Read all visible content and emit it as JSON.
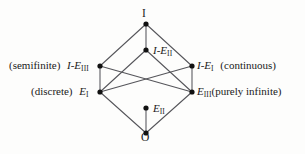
{
  "diagram": {
    "background_color": "#fdfdfc",
    "edge_color": "#55555a",
    "node_color": "#111111",
    "nodes": [
      {
        "id": "top",
        "label": "I",
        "label_html": "I",
        "x": 146,
        "y": 24,
        "label_position": "above"
      },
      {
        "id": "ie2",
        "label": "I-E_II",
        "base": "I-E",
        "subscript": "II",
        "x": 146,
        "y": 50,
        "label_position": "right"
      },
      {
        "id": "ie3",
        "label": "I-E_III",
        "base": "I-E",
        "subscript": "III",
        "prefix_note": "(semifinite)",
        "x": 100,
        "y": 66,
        "label_position": "left"
      },
      {
        "id": "ie1",
        "label": "I-E_I",
        "base": "I-E",
        "subscript": "I",
        "suffix_note": "(continuous)",
        "x": 192,
        "y": 66,
        "label_position": "right"
      },
      {
        "id": "e1",
        "label": "E_I",
        "base": "E",
        "subscript": "I",
        "prefix_note": "(discrete)",
        "x": 100,
        "y": 92,
        "label_position": "left"
      },
      {
        "id": "e3",
        "label": "E_III",
        "base": "E",
        "subscript": "III",
        "suffix_note": "(purely  infinite)",
        "x": 192,
        "y": 92,
        "label_position": "right"
      },
      {
        "id": "e2",
        "label": "E_II",
        "base": "E",
        "subscript": "II",
        "x": 146,
        "y": 108,
        "label_position": "right"
      },
      {
        "id": "bottom",
        "label": "O",
        "label_html": "O",
        "x": 146,
        "y": 133,
        "label_position": "below"
      }
    ],
    "edges": [
      {
        "from": "top",
        "to": "ie3"
      },
      {
        "from": "top",
        "to": "ie2"
      },
      {
        "from": "top",
        "to": "ie1"
      },
      {
        "from": "ie3",
        "to": "e1"
      },
      {
        "from": "ie3",
        "to": "e3"
      },
      {
        "from": "ie1",
        "to": "e3"
      },
      {
        "from": "ie1",
        "to": "e1"
      },
      {
        "from": "ie2",
        "to": "e1"
      },
      {
        "from": "ie2",
        "to": "e3"
      },
      {
        "from": "e1",
        "to": "bottom"
      },
      {
        "from": "e3",
        "to": "bottom"
      },
      {
        "from": "e2",
        "to": "bottom"
      }
    ],
    "labels": {
      "top": "I",
      "bottom": "O",
      "ie2_base": "I-E",
      "ie2_sub": "II",
      "ie3_note": "(semifinite)",
      "ie3_base": "I-E",
      "ie3_sub": "III",
      "ie1_base": "I-E",
      "ie1_sub": "I",
      "ie1_note": "(continuous)",
      "e1_note": "(discrete)",
      "e1_base": "E",
      "e1_sub": "I",
      "e3_base": "E",
      "e3_sub": "III",
      "e3_note": "(purely  infinite)",
      "e2_base": "E",
      "e2_sub": "II"
    }
  }
}
